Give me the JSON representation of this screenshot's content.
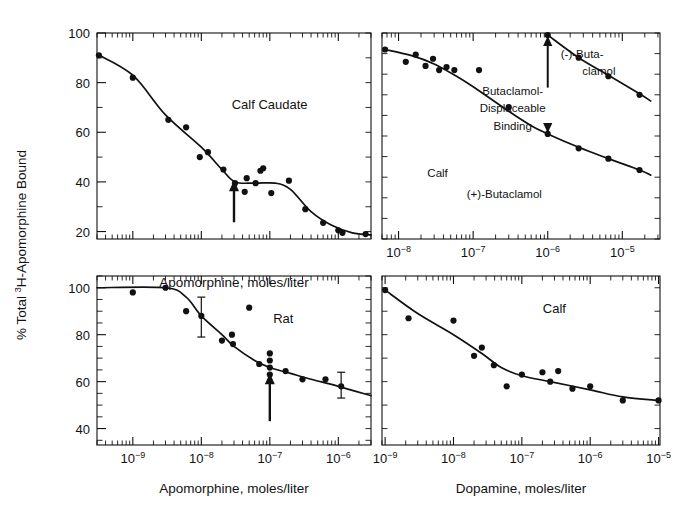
{
  "figure": {
    "y_axis_label_parts": {
      "pre": "% Total ",
      "sup": "3",
      "post": "H-Apomorphine Bound"
    },
    "y_axis_label_plain": "% Total 3H-Apomorphine Bound",
    "background_color": "#ffffff",
    "ink_color": "#111111"
  },
  "chart_data": [
    {
      "id": "panel-top-left",
      "type": "scatter",
      "title": "Calf Caudate",
      "annotation": "Calf Caudate",
      "xlabel": "Apomorphine, moles/liter",
      "ylabel": "% Total 3H-Apomorphine Bound",
      "xscale": "log",
      "xlim": [
        3e-10,
        3e-06
      ],
      "ylim": [
        17,
        100
      ],
      "yticks": [
        20,
        40,
        60,
        80,
        100
      ],
      "ytick_labels": [
        "20",
        "40",
        "60",
        "80",
        "100"
      ],
      "yminor_step": 10,
      "xticks": [
        1e-09,
        1e-08,
        1e-07,
        1e-06
      ],
      "xtick_labels": [
        "10-9",
        "10-8",
        "10-7",
        "10-6"
      ],
      "xtick_labels_shown": false,
      "grid": false,
      "legend": "none",
      "arrow_at_x": 3e-08,
      "points": [
        {
          "x": 3.2e-10,
          "y": 91
        },
        {
          "x": 1e-09,
          "y": 82
        },
        {
          "x": 3.3e-09,
          "y": 65
        },
        {
          "x": 6e-09,
          "y": 62
        },
        {
          "x": 9.5e-09,
          "y": 50
        },
        {
          "x": 1.25e-08,
          "y": 52
        },
        {
          "x": 2.1e-08,
          "y": 45
        },
        {
          "x": 3.1e-08,
          "y": 39.5
        },
        {
          "x": 4.3e-08,
          "y": 36
        },
        {
          "x": 4.6e-08,
          "y": 41.5
        },
        {
          "x": 6.2e-08,
          "y": 39.5
        },
        {
          "x": 7.3e-08,
          "y": 44.5
        },
        {
          "x": 8e-08,
          "y": 45.5
        },
        {
          "x": 1.05e-07,
          "y": 35.5
        },
        {
          "x": 1.9e-07,
          "y": 40.5
        },
        {
          "x": 3.3e-07,
          "y": 29
        },
        {
          "x": 6e-07,
          "y": 23.5
        },
        {
          "x": 1e-06,
          "y": 20.5
        },
        {
          "x": 1.15e-06,
          "y": 19.5
        },
        {
          "x": 2.5e-06,
          "y": 19
        }
      ],
      "curve": [
        {
          "x": 3e-10,
          "y": 91.5
        },
        {
          "x": 1e-09,
          "y": 83
        },
        {
          "x": 3e-09,
          "y": 67
        },
        {
          "x": 1e-08,
          "y": 54
        },
        {
          "x": 2e-08,
          "y": 45
        },
        {
          "x": 3.1e-08,
          "y": 40
        },
        {
          "x": 6e-08,
          "y": 39.5
        },
        {
          "x": 1.2e-07,
          "y": 39.5
        },
        {
          "x": 2e-07,
          "y": 37
        },
        {
          "x": 4e-07,
          "y": 28
        },
        {
          "x": 8e-07,
          "y": 22.5
        },
        {
          "x": 1.6e-06,
          "y": 19.5
        },
        {
          "x": 3e-06,
          "y": 18.7
        }
      ]
    },
    {
      "id": "panel-top-right",
      "type": "scatter",
      "title": "Calf",
      "annotation": "Calf",
      "xlabel": "",
      "ylabel": "% Total 3H-Apomorphine Bound",
      "xscale": "log",
      "xlim": [
        6e-09,
        3.2e-05
      ],
      "ylim": [
        0,
        100
      ],
      "yticks": [],
      "ytick_labels": [],
      "xticks": [
        1e-08,
        1e-07,
        1e-06,
        1e-05
      ],
      "xtick_labels": [
        "10-8",
        "10-7",
        "10-6",
        "10-5"
      ],
      "xtick_labels_shown": true,
      "grid": false,
      "legend": "inline-annotations",
      "annotations": [
        {
          "text": "(-)-Buta-",
          "x_frac": 0.72,
          "y_frac": 0.12
        },
        {
          "text": "clamol",
          "x_frac": 0.78,
          "y_frac": 0.205
        },
        {
          "text": "Butaclamol-",
          "x_frac": 0.47,
          "y_frac": 0.3
        },
        {
          "text": "Displaceable",
          "x_frac": 0.47,
          "y_frac": 0.385
        },
        {
          "text": "Binding",
          "x_frac": 0.47,
          "y_frac": 0.47
        },
        {
          "text": "Calf",
          "x_frac": 0.2,
          "y_frac": 0.7
        },
        {
          "text": "(+)-Butaclamol",
          "x_frac": 0.44,
          "y_frac": 0.8
        }
      ],
      "double_arrow": {
        "x": 1e-06,
        "y_top": 99,
        "y_bottom": 51,
        "label": "Butaclamol-Displaceable Binding"
      },
      "series": [
        {
          "name": "(-)-Butaclamol",
          "points": [
            {
              "x": 1e-06,
              "y": 99
            },
            {
              "x": 2.6e-06,
              "y": 88
            },
            {
              "x": 6.5e-06,
              "y": 79
            },
            {
              "x": 1.7e-05,
              "y": 70
            }
          ],
          "curve": [
            {
              "x": 1e-06,
              "y": 99
            },
            {
              "x": 2.6e-06,
              "y": 88
            },
            {
              "x": 6.5e-06,
              "y": 79.5
            },
            {
              "x": 1.7e-05,
              "y": 70.5
            },
            {
              "x": 2.4e-05,
              "y": 67
            }
          ]
        },
        {
          "name": "(+)-Butaclamol",
          "points": [
            {
              "x": 6.6e-09,
              "y": 92
            },
            {
              "x": 1.25e-08,
              "y": 86
            },
            {
              "x": 1.7e-08,
              "y": 89.5
            },
            {
              "x": 2.3e-08,
              "y": 84
            },
            {
              "x": 2.9e-08,
              "y": 87.5
            },
            {
              "x": 3.5e-08,
              "y": 82
            },
            {
              "x": 4.4e-08,
              "y": 83.5
            },
            {
              "x": 5.6e-08,
              "y": 82
            },
            {
              "x": 1.2e-07,
              "y": 82
            },
            {
              "x": 3e-07,
              "y": 64
            },
            {
              "x": 1e-06,
              "y": 51
            },
            {
              "x": 2.6e-06,
              "y": 44
            },
            {
              "x": 6.5e-06,
              "y": 39
            },
            {
              "x": 1.7e-05,
              "y": 33.5
            }
          ],
          "curve": [
            {
              "x": 6.6e-09,
              "y": 92
            },
            {
              "x": 1.5e-08,
              "y": 89
            },
            {
              "x": 3e-08,
              "y": 85
            },
            {
              "x": 6e-08,
              "y": 79
            },
            {
              "x": 1.2e-07,
              "y": 72
            },
            {
              "x": 3e-07,
              "y": 62
            },
            {
              "x": 6e-07,
              "y": 55
            },
            {
              "x": 1e-06,
              "y": 51
            },
            {
              "x": 2.6e-06,
              "y": 44.5
            },
            {
              "x": 6.5e-06,
              "y": 39
            },
            {
              "x": 1.7e-05,
              "y": 33.5
            },
            {
              "x": 2.4e-05,
              "y": 31
            }
          ]
        }
      ]
    },
    {
      "id": "panel-bottom-left",
      "type": "scatter",
      "title": "Rat",
      "annotation": "Rat",
      "xlabel": "Apomorphine, moles/liter",
      "ylabel": "% Total 3H-Apomorphine Bound",
      "xscale": "log",
      "xlim": [
        3e-10,
        3e-06
      ],
      "ylim": [
        33,
        105
      ],
      "yticks": [
        40,
        60,
        80,
        100
      ],
      "ytick_labels": [
        "40",
        "60",
        "80",
        "100"
      ],
      "yminor_step": 5,
      "xticks": [
        1e-09,
        1e-08,
        1e-07,
        1e-06
      ],
      "xtick_labels": [
        "10-9",
        "10-8",
        "10-7",
        "10-6"
      ],
      "xtick_labels_shown": true,
      "grid": false,
      "legend": "none",
      "arrow_at_x": 1e-07,
      "points": [
        {
          "x": 1e-09,
          "y": 98
        },
        {
          "x": 3e-09,
          "y": 100
        },
        {
          "x": 6e-09,
          "y": 90
        },
        {
          "x": 1e-08,
          "y": 88,
          "err_low": 79,
          "err_high": 96
        },
        {
          "x": 2e-08,
          "y": 77.5
        },
        {
          "x": 2.8e-08,
          "y": 80
        },
        {
          "x": 2.9e-08,
          "y": 76
        },
        {
          "x": 5e-08,
          "y": 91.5
        },
        {
          "x": 7e-08,
          "y": 67.5
        },
        {
          "x": 1e-07,
          "y": 72
        },
        {
          "x": 1e-07,
          "y": 69
        },
        {
          "x": 1e-07,
          "y": 66
        },
        {
          "x": 1e-07,
          "y": 63
        },
        {
          "x": 1.7e-07,
          "y": 64.5
        },
        {
          "x": 3e-07,
          "y": 61
        },
        {
          "x": 6.5e-07,
          "y": 61
        },
        {
          "x": 1.1e-06,
          "y": 58,
          "err_low": 53,
          "err_high": 64
        }
      ],
      "curve": [
        {
          "x": 3e-10,
          "y": 100
        },
        {
          "x": 3e-09,
          "y": 100
        },
        {
          "x": 6e-09,
          "y": 96
        },
        {
          "x": 1e-08,
          "y": 88
        },
        {
          "x": 2e-08,
          "y": 80
        },
        {
          "x": 3e-08,
          "y": 75
        },
        {
          "x": 6e-08,
          "y": 69
        },
        {
          "x": 1e-07,
          "y": 66
        },
        {
          "x": 2e-07,
          "y": 63.5
        },
        {
          "x": 4e-07,
          "y": 61
        },
        {
          "x": 1e-06,
          "y": 58
        },
        {
          "x": 3e-06,
          "y": 54
        }
      ]
    },
    {
      "id": "panel-bottom-right",
      "type": "scatter",
      "title": "Calf",
      "annotation": "Calf",
      "xlabel": "Dopamine, moles/liter",
      "ylabel": "% Total 3H-Apomorphine Bound",
      "xscale": "log",
      "xlim": [
        9e-10,
        1.05e-05
      ],
      "ylim": [
        33,
        105
      ],
      "yticks": [],
      "ytick_labels": [],
      "xticks": [
        1e-09,
        1e-08,
        1e-07,
        1e-06,
        1e-05
      ],
      "xtick_labels": [
        "10-9",
        "10-8",
        "10-7",
        "10-6",
        "10-5"
      ],
      "xtick_labels_shown": true,
      "grid": false,
      "legend": "none",
      "points": [
        {
          "x": 1e-09,
          "y": 99
        },
        {
          "x": 2.2e-09,
          "y": 87
        },
        {
          "x": 1e-08,
          "y": 86
        },
        {
          "x": 2e-08,
          "y": 71
        },
        {
          "x": 2.6e-08,
          "y": 74.5
        },
        {
          "x": 3.9e-08,
          "y": 67
        },
        {
          "x": 6e-08,
          "y": 58
        },
        {
          "x": 1e-07,
          "y": 63
        },
        {
          "x": 2e-07,
          "y": 64
        },
        {
          "x": 2.6e-07,
          "y": 60
        },
        {
          "x": 3.4e-07,
          "y": 64.5
        },
        {
          "x": 5.5e-07,
          "y": 57
        },
        {
          "x": 1e-06,
          "y": 58
        },
        {
          "x": 3e-06,
          "y": 52
        },
        {
          "x": 1e-05,
          "y": 52
        }
      ],
      "curve": [
        {
          "x": 1e-09,
          "y": 99
        },
        {
          "x": 3e-09,
          "y": 89
        },
        {
          "x": 1e-08,
          "y": 80
        },
        {
          "x": 2.6e-08,
          "y": 72
        },
        {
          "x": 5e-08,
          "y": 66
        },
        {
          "x": 1e-07,
          "y": 62.5
        },
        {
          "x": 2.6e-07,
          "y": 60
        },
        {
          "x": 1e-06,
          "y": 56.5
        },
        {
          "x": 3e-06,
          "y": 53.5
        },
        {
          "x": 1e-05,
          "y": 52
        }
      ]
    }
  ]
}
